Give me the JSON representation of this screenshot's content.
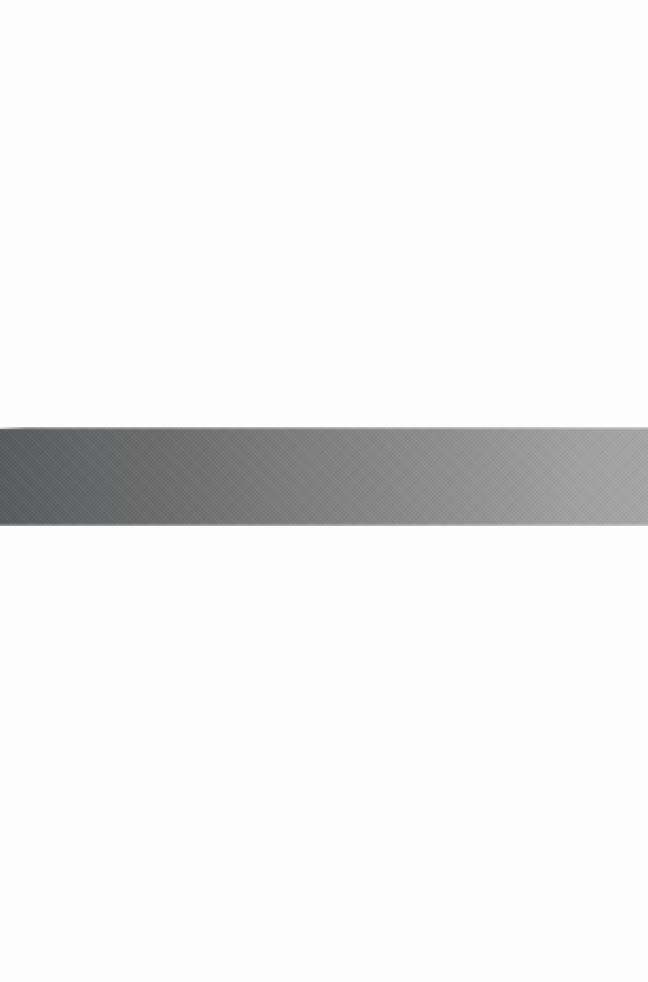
{
  "canvas": {
    "width": 648,
    "height": 982,
    "background_color": "#fdfdfd"
  },
  "band": {
    "name": "horizontal-gradient-band",
    "top": 427,
    "bottom": 526,
    "height": 99,
    "left": 0,
    "width": 648,
    "orientation": "horizontal",
    "gradient_direction": "left-to-right",
    "gradient_description": "dark slate gray at the left edge fading progressively lighter toward the right edge",
    "texture": "subtle diagonal weave / dither pattern",
    "color_start": "#575b5d",
    "color_mid": "#7d7d7d",
    "color_end": "#a5a5a5",
    "gradient_stops": [
      {
        "position_pct": 0,
        "color": "#575b5d"
      },
      {
        "position_pct": 9,
        "color": "#5f6264"
      },
      {
        "position_pct": 23,
        "color": "#6a6a6a"
      },
      {
        "position_pct": 46,
        "color": "#7d7d7d"
      },
      {
        "position_pct": 69,
        "color": "#8e8e8e"
      },
      {
        "position_pct": 89,
        "color": "#a0a0a0"
      },
      {
        "position_pct": 100,
        "color": "#a5a5a5"
      }
    ]
  }
}
